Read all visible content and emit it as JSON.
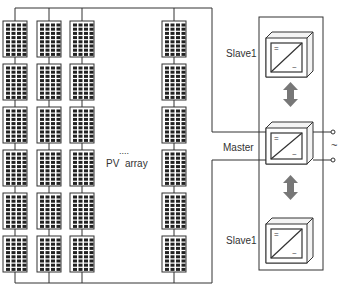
{
  "diagram": {
    "pv_array_label": "PV  array",
    "ellipsis": "....",
    "master_label": "Master",
    "slave_top_label": "Slave1",
    "slave_bottom_label": "Slave1",
    "ac_symbol": "~",
    "dc_symbol": "=",
    "inverter_ac_symbol": "~",
    "panel_columns": 4,
    "panels_per_column": 6,
    "panel_cells": {
      "cols": 4,
      "rows": 8
    },
    "colors": {
      "line": "#333333",
      "panel_fill": "#222222",
      "panel_grid": "#ffffff",
      "arrow": "#777777",
      "inverter_shade": "#e8e8e8"
    }
  }
}
